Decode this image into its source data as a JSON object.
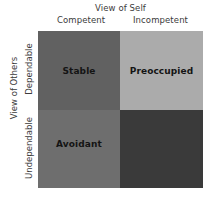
{
  "chart_data": {
    "type": "table",
    "title": "",
    "xlabel": "View of Self",
    "ylabel": "View of Others",
    "x_categories": [
      "Competent",
      "Incompetent"
    ],
    "y_categories": [
      "Dependable",
      "Undependable"
    ],
    "grid": false,
    "legend": "none",
    "cells": [
      {
        "row": "Dependable",
        "column": "Competent",
        "label": "Stable",
        "color": "#616161",
        "label_color": "#141414"
      },
      {
        "row": "Dependable",
        "column": "Incompetent",
        "label": "Preoccupied",
        "color": "#ababab",
        "label_color": "#141414"
      },
      {
        "row": "Undependable",
        "column": "Competent",
        "label": "Avoidant",
        "color": "#6e6e6e",
        "label_color": "#141414"
      },
      {
        "row": "Undependable",
        "column": "Incompetent",
        "label": "",
        "color": "#3a3a3a",
        "label_color": "#141414"
      }
    ]
  },
  "axes": {
    "top": {
      "title": "View of Self",
      "headers": [
        "Competent",
        "Incompetent"
      ]
    },
    "left": {
      "title": "View of Others",
      "headers": [
        "Dependable",
        "Undependable"
      ]
    }
  }
}
